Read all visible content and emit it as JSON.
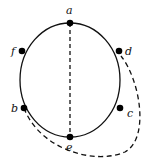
{
  "diagram": {
    "type": "graph",
    "colors": {
      "stroke": "#111111",
      "vertex": "#000000",
      "background": "#ffffff"
    },
    "vertices": [
      {
        "id": "a",
        "label": "a"
      },
      {
        "id": "d",
        "label": "d"
      },
      {
        "id": "c",
        "label": "c"
      },
      {
        "id": "e",
        "label": "e"
      },
      {
        "id": "b",
        "label": "b"
      },
      {
        "id": "f",
        "label": "f"
      }
    ],
    "edges": [
      {
        "from": "a",
        "to": "d",
        "style": "solid",
        "shape": "arc"
      },
      {
        "from": "d",
        "to": "c",
        "style": "solid",
        "shape": "arc"
      },
      {
        "from": "c",
        "to": "e",
        "style": "solid",
        "shape": "arc"
      },
      {
        "from": "e",
        "to": "b",
        "style": "solid",
        "shape": "arc"
      },
      {
        "from": "b",
        "to": "f",
        "style": "solid",
        "shape": "arc"
      },
      {
        "from": "f",
        "to": "a",
        "style": "solid",
        "shape": "arc"
      },
      {
        "from": "a",
        "to": "e",
        "style": "dashed",
        "shape": "straight"
      },
      {
        "from": "b",
        "to": "d",
        "style": "dashed",
        "shape": "curve-outside"
      }
    ]
  }
}
